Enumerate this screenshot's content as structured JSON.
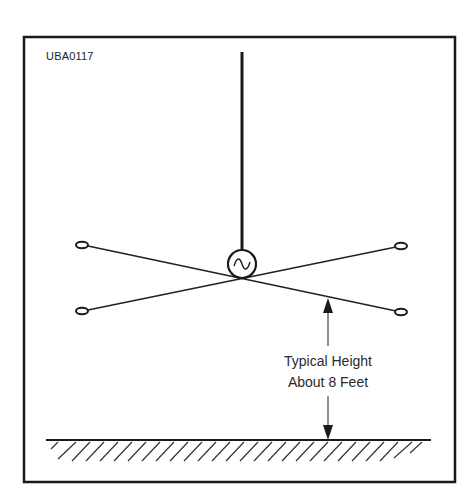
{
  "figure": {
    "id": "UBA0117",
    "label_line1": "Typical Height",
    "label_line2": "About 8 Feet"
  },
  "diagram": {
    "type": "antenna-installation",
    "elements": [
      "vertical-mast",
      "signal-source-circle",
      "crossed-wire-elements",
      "end-insulators",
      "height-dimension-arrow",
      "ground-plane-hatched"
    ],
    "stroke_color": "#1a1a1a"
  }
}
